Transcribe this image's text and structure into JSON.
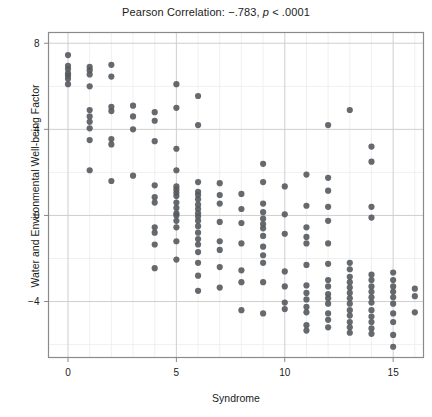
{
  "chart_data": {
    "type": "scatter",
    "title": "Pearson Correlation: −.783, p < .0001",
    "title_prefix": "Pearson Correlation: −.783, ",
    "title_italic": "p",
    "title_suffix": " < .0001",
    "xlabel": "Syndrome",
    "ylabel": "Water and Environmental Well-being Factor",
    "xlim": [
      -0.9,
      16.4
    ],
    "ylim": [
      -6.6,
      8.5
    ],
    "xticks": [
      0,
      5,
      10,
      15
    ],
    "xtick_labels": [
      "0",
      "5",
      "10",
      "15"
    ],
    "yticks": [
      -4,
      0,
      4,
      8
    ],
    "ytick_labels": [
      "-4",
      "0",
      "4",
      "8"
    ],
    "grid": true,
    "grid_x_minor": [
      1,
      2,
      3,
      4,
      6,
      7,
      8,
      9,
      11,
      12,
      13,
      14,
      16
    ],
    "grid_y_minor": [
      -6,
      -2,
      2,
      6
    ],
    "legend": "none",
    "point_color": "#555a5e",
    "point_size": 3.1,
    "axis_color": "#7a7a7a",
    "grid_color": "#d8d8d8",
    "correlation": -0.783,
    "p_value": "< .0001",
    "n_points": 188,
    "points": [
      [
        0,
        7.45
      ],
      [
        0,
        6.95
      ],
      [
        0,
        6.8
      ],
      [
        0,
        6.6
      ],
      [
        0,
        6.5
      ],
      [
        0,
        6.35
      ],
      [
        0,
        6.1
      ],
      [
        1,
        6.9
      ],
      [
        1,
        6.75
      ],
      [
        1,
        6.55
      ],
      [
        1,
        6.0
      ],
      [
        1,
        4.9
      ],
      [
        1,
        4.6
      ],
      [
        1,
        4.35
      ],
      [
        1,
        4.05
      ],
      [
        1,
        3.5
      ],
      [
        1,
        2.1
      ],
      [
        2,
        7.0
      ],
      [
        2,
        6.45
      ],
      [
        2,
        5.05
      ],
      [
        2,
        4.85
      ],
      [
        2,
        3.55
      ],
      [
        2,
        3.3
      ],
      [
        2,
        1.6
      ],
      [
        3,
        5.1
      ],
      [
        3,
        4.6
      ],
      [
        3,
        4.0
      ],
      [
        3,
        1.85
      ],
      [
        4,
        4.8
      ],
      [
        4,
        4.4
      ],
      [
        4,
        3.45
      ],
      [
        4,
        1.4
      ],
      [
        4,
        0.85
      ],
      [
        4,
        0.6
      ],
      [
        4,
        -0.55
      ],
      [
        4,
        -0.8
      ],
      [
        4,
        -1.35
      ],
      [
        4,
        -2.45
      ],
      [
        5,
        6.1
      ],
      [
        5,
        5.0
      ],
      [
        5,
        3.1
      ],
      [
        5,
        2.1
      ],
      [
        5,
        1.35
      ],
      [
        5,
        1.2
      ],
      [
        5,
        1.05
      ],
      [
        5,
        0.9
      ],
      [
        5,
        0.6
      ],
      [
        5,
        0.35
      ],
      [
        5,
        0.1
      ],
      [
        5,
        0.0
      ],
      [
        5,
        -0.25
      ],
      [
        5,
        -0.55
      ],
      [
        5,
        -1.2
      ],
      [
        5,
        -2.05
      ],
      [
        6,
        5.55
      ],
      [
        6,
        4.2
      ],
      [
        6,
        1.55
      ],
      [
        6,
        1.1
      ],
      [
        6,
        0.95
      ],
      [
        6,
        0.75
      ],
      [
        6,
        0.5
      ],
      [
        6,
        0.3
      ],
      [
        6,
        0.1
      ],
      [
        6,
        -0.05
      ],
      [
        6,
        -0.25
      ],
      [
        6,
        -0.5
      ],
      [
        6,
        -0.8
      ],
      [
        6,
        -1.1
      ],
      [
        6,
        -1.35
      ],
      [
        6,
        -1.7
      ],
      [
        6,
        -2.2
      ],
      [
        6,
        -2.8
      ],
      [
        6,
        -3.5
      ],
      [
        7,
        1.5
      ],
      [
        7,
        0.95
      ],
      [
        7,
        0.55
      ],
      [
        7,
        -0.3
      ],
      [
        7,
        -1.2
      ],
      [
        7,
        -1.6
      ],
      [
        7,
        -2.4
      ],
      [
        7,
        -3.35
      ],
      [
        8,
        1.0
      ],
      [
        8,
        0.3
      ],
      [
        8,
        -0.35
      ],
      [
        8,
        -1.3
      ],
      [
        8,
        -2.55
      ],
      [
        8,
        -3.1
      ],
      [
        8,
        -4.4
      ],
      [
        9,
        2.4
      ],
      [
        9,
        1.55
      ],
      [
        9,
        0.55
      ],
      [
        9,
        0.15
      ],
      [
        9,
        -0.15
      ],
      [
        9,
        -0.4
      ],
      [
        9,
        -0.6
      ],
      [
        9,
        -0.95
      ],
      [
        9,
        -1.45
      ],
      [
        9,
        -1.85
      ],
      [
        9,
        -2.2
      ],
      [
        9,
        -3.1
      ],
      [
        9,
        -4.55
      ],
      [
        10,
        1.35
      ],
      [
        10,
        0.05
      ],
      [
        10,
        -0.85
      ],
      [
        10,
        -2.6
      ],
      [
        10,
        -3.3
      ],
      [
        10,
        -4.05
      ],
      [
        10,
        -4.35
      ],
      [
        11,
        1.9
      ],
      [
        11,
        0.45
      ],
      [
        11,
        -0.55
      ],
      [
        11,
        -1.0
      ],
      [
        11,
        -1.3
      ],
      [
        11,
        -2.3
      ],
      [
        11,
        -3.25
      ],
      [
        11,
        -3.6
      ],
      [
        11,
        -3.9
      ],
      [
        11,
        -4.25
      ],
      [
        11,
        -4.5
      ],
      [
        11,
        -5.1
      ],
      [
        11,
        -5.35
      ],
      [
        12,
        4.2
      ],
      [
        12,
        1.75
      ],
      [
        12,
        1.15
      ],
      [
        12,
        0.4
      ],
      [
        12,
        -0.25
      ],
      [
        12,
        -1.3
      ],
      [
        12,
        -2.25
      ],
      [
        12,
        -3.0
      ],
      [
        12,
        -3.3
      ],
      [
        12,
        -3.65
      ],
      [
        12,
        -3.85
      ],
      [
        12,
        -4.1
      ],
      [
        12,
        -4.55
      ],
      [
        12,
        -4.85
      ],
      [
        12,
        -5.2
      ],
      [
        13,
        4.9
      ],
      [
        13,
        -2.2
      ],
      [
        13,
        -2.5
      ],
      [
        13,
        -2.85
      ],
      [
        13,
        -3.1
      ],
      [
        13,
        -3.35
      ],
      [
        13,
        -3.6
      ],
      [
        13,
        -3.85
      ],
      [
        13,
        -4.1
      ],
      [
        13,
        -4.4
      ],
      [
        13,
        -4.65
      ],
      [
        13,
        -4.95
      ],
      [
        13,
        -5.2
      ],
      [
        13,
        -5.45
      ],
      [
        14,
        3.2
      ],
      [
        14,
        2.5
      ],
      [
        14,
        0.4
      ],
      [
        14,
        -0.1
      ],
      [
        14,
        -2.75
      ],
      [
        14,
        -3.0
      ],
      [
        14,
        -3.3
      ],
      [
        14,
        -3.55
      ],
      [
        14,
        -3.8
      ],
      [
        14,
        -4.05
      ],
      [
        14,
        -4.4
      ],
      [
        14,
        -4.7
      ],
      [
        14,
        -4.95
      ],
      [
        14,
        -5.25
      ],
      [
        14,
        -5.5
      ],
      [
        15,
        -2.65
      ],
      [
        15,
        -3.0
      ],
      [
        15,
        -3.3
      ],
      [
        15,
        -3.55
      ],
      [
        15,
        -3.8
      ],
      [
        15,
        -4.1
      ],
      [
        15,
        -4.55
      ],
      [
        15,
        -4.95
      ],
      [
        15,
        -5.55
      ],
      [
        15,
        -6.1
      ],
      [
        16,
        -3.4
      ],
      [
        16,
        -3.75
      ],
      [
        16,
        -4.5
      ]
    ]
  }
}
